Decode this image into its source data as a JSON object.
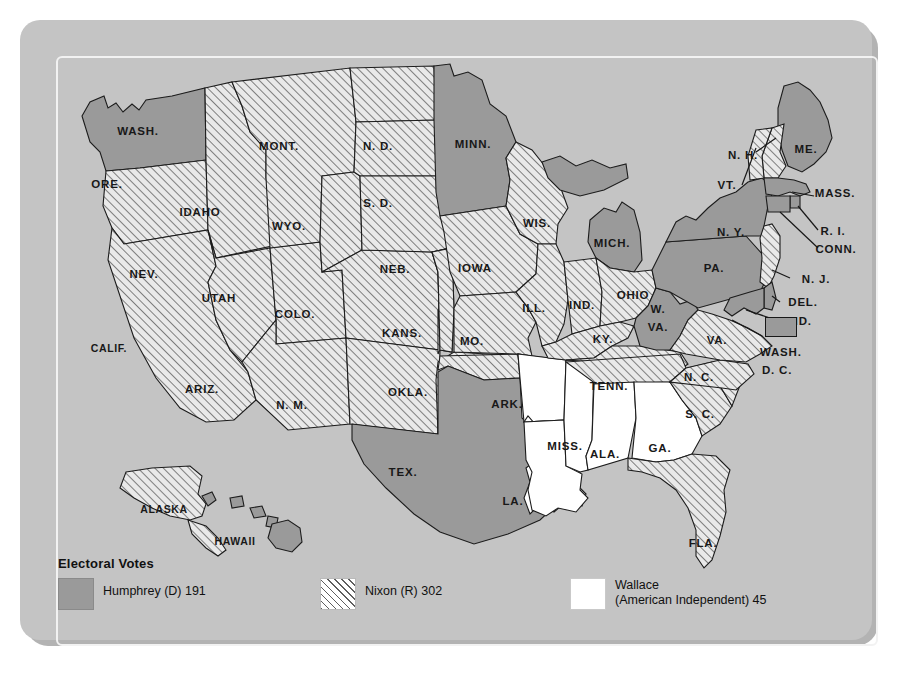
{
  "figure": {
    "kind": "choropleth-map",
    "background_color": "#c4c4c4",
    "panel_border_color": "#f2f2f2"
  },
  "legend": {
    "title": "Electoral Votes",
    "items": [
      {
        "key": "humphrey",
        "pattern": "solid-gray",
        "swatch_color": "#9a9a9a",
        "label_line1": "Humphrey (D) 191",
        "label_line2": "",
        "votes": 191,
        "candidate": "Humphrey",
        "party": "D"
      },
      {
        "key": "nixon",
        "pattern": "diagonal-hatch",
        "swatch_color": "#ffffff",
        "label_line1": "Nixon (R) 302",
        "label_line2": "",
        "votes": 302,
        "candidate": "Nixon",
        "party": "R"
      },
      {
        "key": "wallace",
        "pattern": "white",
        "swatch_color": "#ffffff",
        "label_line1": "Wallace",
        "label_line2": "(American Independent) 45",
        "votes": 45,
        "candidate": "Wallace",
        "party": "American Independent"
      }
    ]
  },
  "map": {
    "dc_callout": {
      "label_line1": "WASH.",
      "label_line2": "D. C.",
      "pattern": "solid-gray"
    },
    "states": [
      {
        "code": "WASH.",
        "label": "WASH.",
        "winner": "humphrey",
        "lx": 118,
        "ly": 111
      },
      {
        "code": "ORE.",
        "label": "ORE.",
        "winner": "nixon",
        "lx": 87,
        "ly": 164
      },
      {
        "code": "CALIF.",
        "label": "CALIF.",
        "winner": "nixon",
        "lx": 89,
        "ly": 328
      },
      {
        "code": "IDAHO",
        "label": "IDAHO",
        "winner": "nixon",
        "lx": 180,
        "ly": 192
      },
      {
        "code": "NEV.",
        "label": "NEV.",
        "winner": "nixon",
        "lx": 124,
        "ly": 254
      },
      {
        "code": "UTAH",
        "label": "UTAH",
        "winner": "nixon",
        "lx": 199,
        "ly": 278
      },
      {
        "code": "ARIZ.",
        "label": "ARIZ.",
        "winner": "nixon",
        "lx": 182,
        "ly": 369
      },
      {
        "code": "MONT.",
        "label": "MONT.",
        "winner": "nixon",
        "lx": 259,
        "ly": 126
      },
      {
        "code": "WYO.",
        "label": "WYO.",
        "winner": "nixon",
        "lx": 269,
        "ly": 206
      },
      {
        "code": "COLO.",
        "label": "COLO.",
        "winner": "nixon",
        "lx": 275,
        "ly": 294
      },
      {
        "code": "N. M.",
        "label": "N. M.",
        "winner": "nixon",
        "lx": 272,
        "ly": 385
      },
      {
        "code": "N. D.",
        "label": "N. D.",
        "winner": "nixon",
        "lx": 358,
        "ly": 126
      },
      {
        "code": "S. D.",
        "label": "S. D.",
        "winner": "nixon",
        "lx": 358,
        "ly": 183
      },
      {
        "code": "NEB.",
        "label": "NEB.",
        "winner": "nixon",
        "lx": 375,
        "ly": 249
      },
      {
        "code": "KANS.",
        "label": "KANS.",
        "winner": "nixon",
        "lx": 382,
        "ly": 313
      },
      {
        "code": "OKLA.",
        "label": "OKLA.",
        "winner": "nixon",
        "lx": 388,
        "ly": 372
      },
      {
        "code": "TEX.",
        "label": "TEX.",
        "winner": "humphrey",
        "lx": 383,
        "ly": 452
      },
      {
        "code": "MINN.",
        "label": "MINN.",
        "winner": "humphrey",
        "lx": 453,
        "ly": 124
      },
      {
        "code": "IOWA",
        "label": "IOWA",
        "winner": "nixon",
        "lx": 455,
        "ly": 248
      },
      {
        "code": "MO.",
        "label": "MO.",
        "winner": "nixon",
        "lx": 452,
        "ly": 321
      },
      {
        "code": "ARK.",
        "label": "ARK.",
        "winner": "wallace",
        "lx": 487,
        "ly": 384
      },
      {
        "code": "LA.",
        "label": "LA.",
        "winner": "wallace",
        "lx": 493,
        "ly": 481
      },
      {
        "code": "WIS.",
        "label": "WIS.",
        "winner": "nixon",
        "lx": 517,
        "ly": 203
      },
      {
        "code": "ILL.",
        "label": "ILL.",
        "winner": "nixon",
        "lx": 514,
        "ly": 288
      },
      {
        "code": "MISS.",
        "label": "MISS.",
        "winner": "wallace",
        "lx": 545,
        "ly": 426
      },
      {
        "code": "IND.",
        "label": "IND.",
        "winner": "nixon",
        "lx": 562,
        "ly": 285
      },
      {
        "code": "MICH.",
        "label": "MICH.",
        "winner": "humphrey",
        "lx": 592,
        "ly": 223
      },
      {
        "code": "OHIO",
        "label": "OHIO",
        "winner": "nixon",
        "lx": 613,
        "ly": 275
      },
      {
        "code": "KY.",
        "label": "KY.",
        "winner": "nixon",
        "lx": 583,
        "ly": 319
      },
      {
        "code": "TENN.",
        "label": "TENN.",
        "winner": "nixon",
        "lx": 589,
        "ly": 366
      },
      {
        "code": "ALA.",
        "label": "ALA.",
        "winner": "wallace",
        "lx": 585,
        "ly": 434
      },
      {
        "code": "GA.",
        "label": "GA.",
        "winner": "wallace",
        "lx": 640,
        "ly": 428
      },
      {
        "code": "FLA.",
        "label": "FLA.",
        "winner": "nixon",
        "lx": 683,
        "ly": 523
      },
      {
        "code": "S. C.",
        "label": "S. C.",
        "winner": "nixon",
        "lx": 680,
        "ly": 394
      },
      {
        "code": "N. C.",
        "label": "N. C.",
        "winner": "nixon",
        "lx": 679,
        "ly": 357
      },
      {
        "code": "W. VA.",
        "label": "W.",
        "label2": "VA.",
        "winner": "humphrey",
        "lx": 638,
        "ly": 298
      },
      {
        "code": "VA.",
        "label": "VA.",
        "winner": "nixon",
        "lx": 697,
        "ly": 320
      },
      {
        "code": "PA.",
        "label": "PA.",
        "winner": "humphrey",
        "lx": 694,
        "ly": 248
      },
      {
        "code": "N. Y.",
        "label": "N. Y.",
        "winner": "humphrey",
        "lx": 711,
        "ly": 212
      },
      {
        "code": "ME.",
        "label": "ME.",
        "winner": "humphrey",
        "lx": 786,
        "ly": 129
      },
      {
        "code": "N. H.",
        "label": "N. H.",
        "winner": "nixon",
        "lx": 723,
        "ly": 135
      },
      {
        "code": "VT.",
        "label": "VT.",
        "winner": "nixon",
        "lx": 707,
        "ly": 165
      },
      {
        "code": "MASS.",
        "label": "MASS.",
        "winner": "humphrey",
        "lx": 815,
        "ly": 173
      },
      {
        "code": "R. I.",
        "label": "R. I.",
        "winner": "humphrey",
        "lx": 813,
        "ly": 211
      },
      {
        "code": "CONN.",
        "label": "CONN.",
        "winner": "humphrey",
        "lx": 816,
        "ly": 229
      },
      {
        "code": "N. J.",
        "label": "N. J.",
        "winner": "nixon",
        "lx": 796,
        "ly": 259
      },
      {
        "code": "DEL.",
        "label": "DEL.",
        "winner": "humphrey",
        "lx": 783,
        "ly": 282
      },
      {
        "code": "MD.",
        "label": "MD.",
        "winner": "humphrey",
        "lx": 780,
        "ly": 301
      },
      {
        "code": "ALASKA",
        "label": "ALASKA",
        "winner": "nixon",
        "lx": 144,
        "ly": 489
      },
      {
        "code": "HAWAII",
        "label": "HAWAII",
        "winner": "humphrey",
        "lx": 215,
        "ly": 521
      }
    ]
  }
}
